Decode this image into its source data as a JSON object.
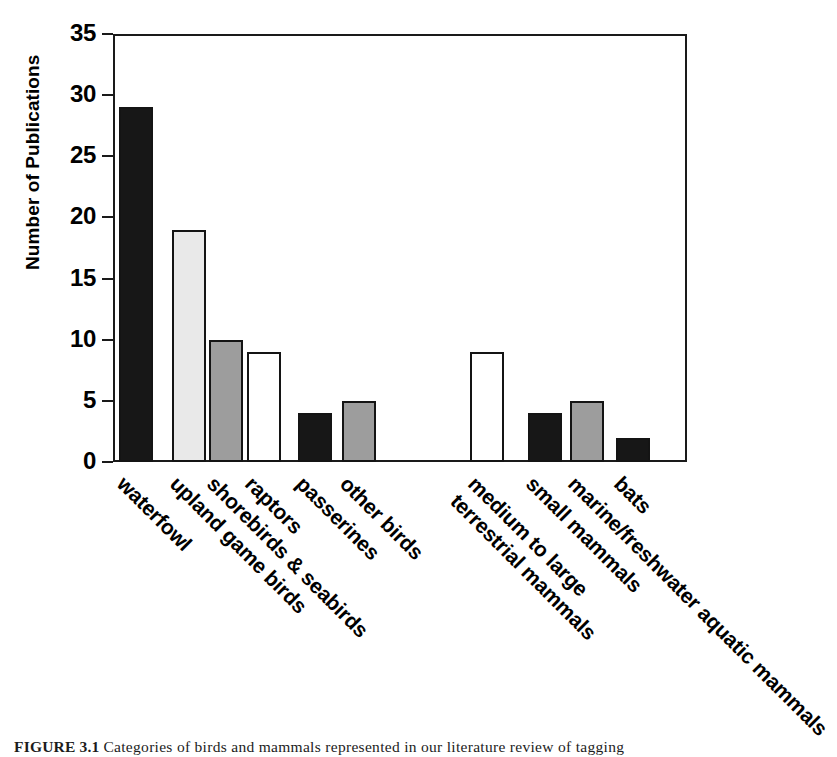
{
  "figure": {
    "caption_number": "FIGURE 3.1",
    "caption_text": "Categories of birds and mammals represented in our literature review of tagging"
  },
  "chart_data": {
    "type": "bar",
    "title": "",
    "xlabel": "",
    "ylabel": "Number of Publications",
    "ylim": [
      0,
      35
    ],
    "ytick_step": 5,
    "ytick_labels": [
      "0",
      "5",
      "10",
      "15",
      "20",
      "25",
      "30",
      "35"
    ],
    "grid": false,
    "legend": "none",
    "categories": [
      "waterfowl",
      "upland game birds",
      "shorebirds & seabirds",
      "raptors",
      "passerines",
      "other birds",
      "medium to large terrestrial mammals",
      "small mammals",
      "marine/freshwater aquatic mammals",
      "bats"
    ],
    "values": [
      29,
      19,
      10,
      9,
      4,
      5,
      9,
      4,
      5,
      2
    ],
    "bar_fills": [
      "black",
      "lightgray",
      "gray",
      "white",
      "black",
      "gray",
      "white",
      "black",
      "gray",
      "black"
    ],
    "groups": [
      {
        "name": "birds",
        "categories": [
          "waterfowl",
          "upland game birds",
          "shorebirds & seabirds",
          "raptors",
          "passerines",
          "other birds"
        ]
      },
      {
        "name": "mammals",
        "categories": [
          "medium to large terrestrial mammals",
          "small mammals",
          "marine/freshwater aquatic mammals",
          "bats"
        ]
      }
    ]
  },
  "xaxis": {
    "labels": [
      {
        "line1": "waterfowl",
        "line2": ""
      },
      {
        "line1": "upland game birds",
        "line2": ""
      },
      {
        "line1": "shorebirds & seabirds",
        "line2": ""
      },
      {
        "line1": "raptors",
        "line2": ""
      },
      {
        "line1": "passerines",
        "line2": ""
      },
      {
        "line1": "other birds",
        "line2": ""
      },
      {
        "line1": "medium to large",
        "line2": "terrestrial mammals"
      },
      {
        "line1": "small mammals",
        "line2": ""
      },
      {
        "line1": "marine/freshwater aquatic mammals",
        "line2": ""
      },
      {
        "line1": "bats",
        "line2": ""
      }
    ]
  },
  "colors": {
    "black": "#171717",
    "lightgray": "#e9e9e9",
    "gray": "#9d9d9d",
    "white": "#ffffff",
    "axis": "#1a1a1a"
  }
}
